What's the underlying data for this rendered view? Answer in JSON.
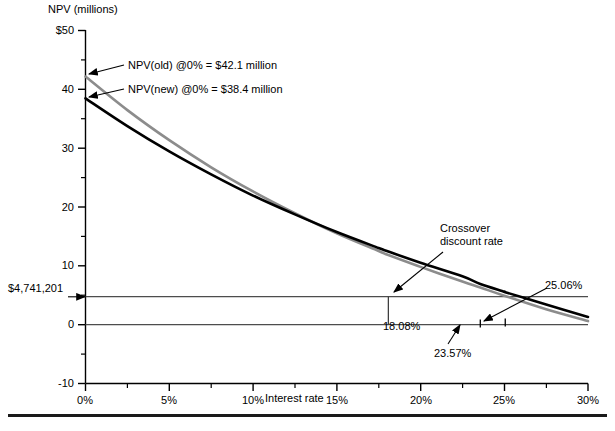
{
  "figure": {
    "y_axis_title": "NPV (millions)",
    "x_axis_title": "Interest rate"
  },
  "chart_data": {
    "type": "line",
    "title": "",
    "xlabel": "Interest rate",
    "ylabel": "NPV (millions)",
    "xlim": [
      0,
      30
    ],
    "ylim": [
      -10,
      50
    ],
    "grid": false,
    "legend": "none",
    "x_ticks": [
      "0%",
      "5%",
      "10%",
      "15%",
      "20%",
      "25%",
      "30%"
    ],
    "x_tick_values": [
      0,
      5,
      10,
      15,
      20,
      25,
      30
    ],
    "x_minor_tick_values": [
      2.5,
      7.5,
      12.5,
      17.5,
      22.5,
      27.5
    ],
    "y_ticks": [
      "$50",
      "40",
      "30",
      "20",
      "10",
      "0",
      "-10"
    ],
    "y_tick_values": [
      50,
      40,
      30,
      20,
      10,
      0,
      -10
    ],
    "y_minor_tick_values": [
      45,
      35,
      25,
      15,
      5,
      -5
    ],
    "series": [
      {
        "name": "NPV(old)",
        "color": "#8c8c8c",
        "npv_at_zero": 42.1,
        "irr": 23.57,
        "x": [
          0,
          2.5,
          5,
          7.5,
          10,
          12.5,
          15,
          17.5,
          18.08,
          20,
          22.5,
          23.57,
          25,
          27.5,
          30
        ],
        "y": [
          42.1,
          36.4,
          31.3,
          26.7,
          22.6,
          18.9,
          15.5,
          12.5,
          11.8,
          9.8,
          7.3,
          6.3,
          4.9,
          2.6,
          0.6
        ]
      },
      {
        "name": "NPV(new)",
        "color": "#000000",
        "npv_at_zero": 38.4,
        "irr": 25.06,
        "x": [
          0,
          2.5,
          5,
          7.5,
          10,
          12.5,
          15,
          17.5,
          18.08,
          20,
          22.5,
          23.57,
          25,
          25.06,
          27.5,
          30
        ],
        "y": [
          38.4,
          33.7,
          29.4,
          25.5,
          21.9,
          18.7,
          15.7,
          13.0,
          12.4,
          10.5,
          8.2,
          6.9,
          5.6,
          5.5,
          3.4,
          1.3
        ]
      }
    ],
    "crossover": {
      "rate_percent": 18.08,
      "rate_label": "18.08%",
      "npv_label": "$4,741,201",
      "npv_value_millions": 4.741201
    },
    "reference_lines": [
      {
        "name": "zero-line",
        "y": 0
      },
      {
        "name": "crossover-npv-line",
        "y": 4.741201
      }
    ],
    "annotations": [
      {
        "name": "npv-old-callout",
        "text": "NPV(old) @0% = $42.1 million"
      },
      {
        "name": "npv-new-callout",
        "text": "NPV(new) @0% = $38.4 million"
      },
      {
        "name": "crossover-callout-line1",
        "text": "Crossover"
      },
      {
        "name": "crossover-callout-line2",
        "text": "discount rate"
      },
      {
        "name": "crossover-rate",
        "text": "18.08%"
      },
      {
        "name": "old-irr",
        "text": "23.57%"
      },
      {
        "name": "new-irr",
        "text": "25.06%"
      },
      {
        "name": "crossover-npv",
        "text": "$4,741,201"
      }
    ]
  },
  "colors": {
    "old_curve": "#8c8c8c",
    "new_curve": "#000000",
    "axis": "#000000",
    "reference_line": "#555555"
  }
}
